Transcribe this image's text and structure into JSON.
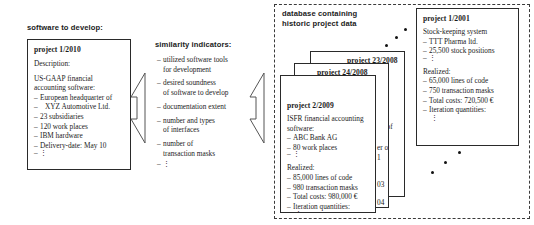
{
  "left_panel": {
    "label": "software to develop:",
    "label_bold_part": "software to",
    "label_rest": "develop:",
    "card": {
      "title": "project 1/2010",
      "description_label": "Description:",
      "summary_line1": "US-GAAP financial",
      "summary_line2": "accounting software:",
      "bullets": [
        "European headquarter of",
        "XYZ Automotive Ltd.",
        "23 subsidiaries",
        "120 work places",
        "IBM hardware",
        "Delivery-date: May 10"
      ],
      "continuation": "⋮"
    }
  },
  "similarity": {
    "label": "similarity indicators:",
    "items": [
      [
        "utilized software tools",
        "for development"
      ],
      [
        "desired soundness",
        "of software to develop"
      ],
      [
        "documentation extent"
      ],
      [
        "number and types",
        "of interfaces"
      ],
      [
        "number of",
        "transaction masks"
      ]
    ],
    "continuation": "⋮"
  },
  "database": {
    "label_line1": "database containing",
    "label_line2": "historic project data",
    "cards": [
      {
        "id": "project-1-2001",
        "title": "project 1/2001",
        "summary": "Stock-keeping system",
        "summary_bullets": [
          "TTT Pharma ltd.",
          "25,500 stock positions"
        ],
        "summary_continuation": "⋮",
        "realized_label": "Realized:",
        "realized_bullets": [
          "65,000 lines of code",
          "750 transaction masks",
          "Total costs: 720,500 €",
          "Iteration quantities:"
        ],
        "realized_continuation": "⋮"
      },
      {
        "id": "project-23-2008",
        "title": "project 23/2008",
        "peek": [
          "er of",
          "d."
        ]
      },
      {
        "id": "project-24-2008",
        "title": "project 24/2008",
        "peek": [
          "er of",
          "1",
          "03",
          "04"
        ]
      },
      {
        "id": "project-2-2009",
        "title": "project 2/2009",
        "summary_line1": "ISFR financial accounting",
        "summary_line2": "software:",
        "summary_bullets": [
          "ABC Bank AG",
          "80 work places"
        ],
        "summary_continuation": "⋮",
        "realized_label": "Realized:",
        "realized_bullets": [
          "85,000 lines of code",
          "980 transaction masks",
          "Total costs: 980,000 €",
          "Iteration quantities:"
        ],
        "realized_continuation": "⋮"
      }
    ],
    "more_indicator_top": "⋰",
    "more_indicator_bottom": "⋰"
  },
  "arrows": [
    {
      "name": "arrow-develop-to-indicators"
    },
    {
      "name": "arrow-indicators-to-database"
    }
  ],
  "colors": {
    "stroke": "#2a2a2a",
    "text": "#1b1b1b",
    "background": "#ffffff",
    "dot": "#111111"
  }
}
